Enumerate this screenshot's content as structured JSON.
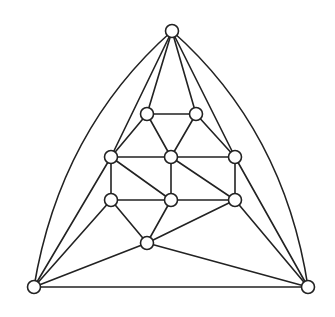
{
  "diagram": {
    "type": "planar-graph",
    "style": {
      "stroke": "#222222",
      "node_fill": "#ffffff",
      "background": "#ffffff",
      "node_radius": 6.5
    },
    "nodes": [
      {
        "id": "top",
        "x": 172,
        "y": 31
      },
      {
        "id": "bl",
        "x": 34,
        "y": 287
      },
      {
        "id": "br",
        "x": 308,
        "y": 287
      },
      {
        "id": "u1",
        "x": 147,
        "y": 114
      },
      {
        "id": "u2",
        "x": 196,
        "y": 114
      },
      {
        "id": "m1",
        "x": 111,
        "y": 157
      },
      {
        "id": "m2",
        "x": 171,
        "y": 157
      },
      {
        "id": "m3",
        "x": 235,
        "y": 157
      },
      {
        "id": "l1",
        "x": 111,
        "y": 200
      },
      {
        "id": "l2",
        "x": 171,
        "y": 200
      },
      {
        "id": "l3",
        "x": 235,
        "y": 200
      },
      {
        "id": "b",
        "x": 147,
        "y": 243
      }
    ],
    "edges": [
      {
        "from": "top",
        "to": "bl",
        "curve": {
          "cx": 60,
          "cy": 130
        }
      },
      {
        "from": "top",
        "to": "br",
        "curve": {
          "cx": 284,
          "cy": 130
        }
      },
      {
        "from": "top",
        "to": "m1"
      },
      {
        "from": "top",
        "to": "u1"
      },
      {
        "from": "top",
        "to": "u2"
      },
      {
        "from": "top",
        "to": "m3"
      },
      {
        "from": "bl",
        "to": "br"
      },
      {
        "from": "bl",
        "to": "m1"
      },
      {
        "from": "bl",
        "to": "l1"
      },
      {
        "from": "bl",
        "to": "b"
      },
      {
        "from": "br",
        "to": "m3"
      },
      {
        "from": "br",
        "to": "l3"
      },
      {
        "from": "br",
        "to": "b"
      },
      {
        "from": "u1",
        "to": "u2"
      },
      {
        "from": "u1",
        "to": "m1"
      },
      {
        "from": "u1",
        "to": "m2"
      },
      {
        "from": "u2",
        "to": "m2"
      },
      {
        "from": "u2",
        "to": "m3"
      },
      {
        "from": "m1",
        "to": "m2"
      },
      {
        "from": "m2",
        "to": "m3"
      },
      {
        "from": "m1",
        "to": "l1"
      },
      {
        "from": "m1",
        "to": "l2"
      },
      {
        "from": "m2",
        "to": "l2"
      },
      {
        "from": "m2",
        "to": "l3"
      },
      {
        "from": "m3",
        "to": "l3"
      },
      {
        "from": "l1",
        "to": "l2"
      },
      {
        "from": "l2",
        "to": "l3"
      },
      {
        "from": "l1",
        "to": "b"
      },
      {
        "from": "l2",
        "to": "b"
      },
      {
        "from": "l3",
        "to": "b"
      }
    ]
  }
}
